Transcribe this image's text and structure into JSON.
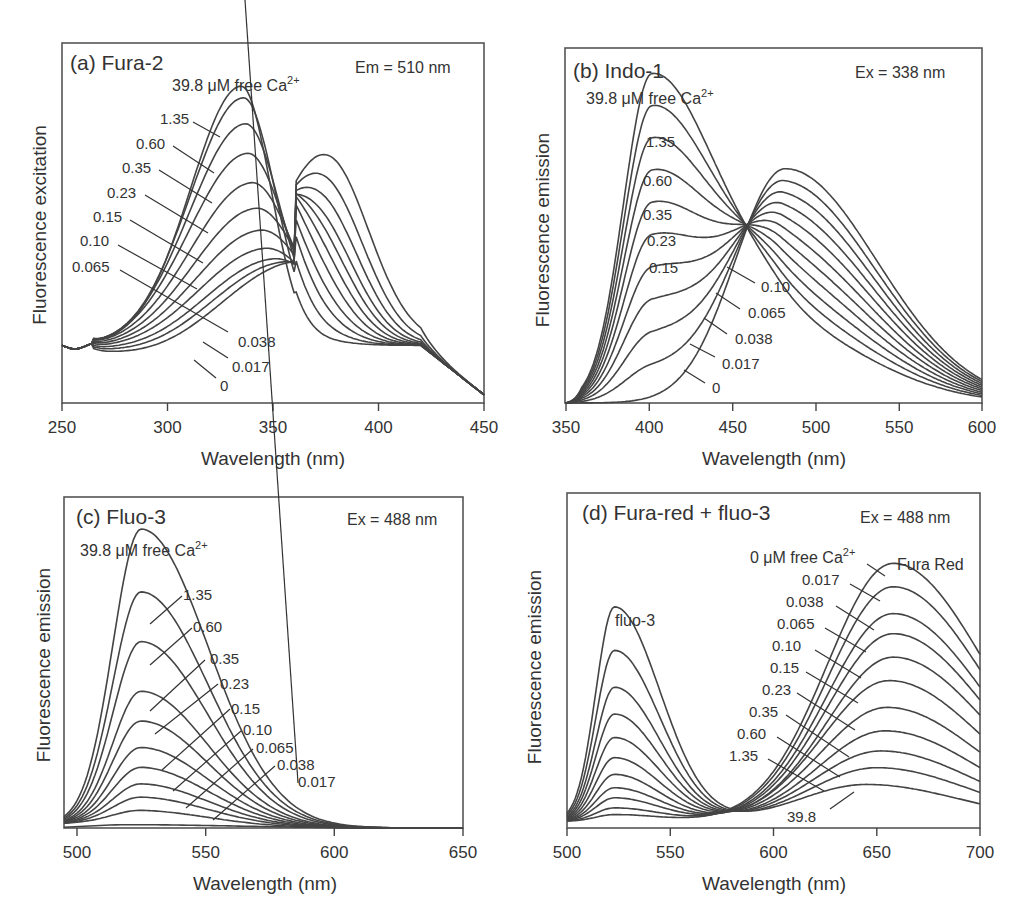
{
  "chart_data": [
    {
      "type": "line",
      "panel": "a",
      "title": "(a) Fura-2",
      "condition": "Em = 510 nm",
      "top_label": "39.8 μM free Ca2+",
      "xlabel": "Wavelength (nm)",
      "ylabel": "Fluorescence excitation",
      "xlim": [
        250,
        450
      ],
      "xticks": [
        250,
        300,
        350,
        400,
        450
      ],
      "grid": false,
      "isosbestic_point_nm": 360,
      "series_labels": [
        "39.8",
        "1.35",
        "0.60",
        "0.35",
        "0.23",
        "0.15",
        "0.10",
        "0.065",
        "0.038",
        "0.017",
        "0"
      ],
      "series": [
        {
          "name": "39.8",
          "peak_nm": 335,
          "peak_rel": 0.88
        },
        {
          "name": "1.35",
          "peak_nm": 336,
          "peak_rel": 0.85
        },
        {
          "name": "0.60",
          "peak_nm": 337,
          "peak_rel": 0.78
        },
        {
          "name": "0.35",
          "peak_nm": 338,
          "peak_rel": 0.7
        },
        {
          "name": "0.23",
          "peak_nm": 340,
          "peak_rel": 0.62
        },
        {
          "name": "0.15",
          "peak_nm": 342,
          "peak_rel": 0.55
        },
        {
          "name": "0.10",
          "peak_nm": 344,
          "peak_rel": 0.49
        },
        {
          "name": "0.065",
          "peak_nm": 346,
          "peak_rel": 0.44
        },
        {
          "name": "0.038",
          "peak_nm": 350,
          "peak_rel": 0.41
        },
        {
          "name": "0.017",
          "peak_nm": 355,
          "peak_rel": 0.4
        },
        {
          "name": "0",
          "peak_nm": 362,
          "peak_rel": 0.4
        }
      ]
    },
    {
      "type": "line",
      "panel": "b",
      "title": "(b) Indo-1",
      "condition": "Ex = 338 nm",
      "top_label": "39.8 μM free Ca2+",
      "xlabel": "Wavelength (nm)",
      "ylabel": "Fluorescence emission",
      "xlim": [
        350,
        600
      ],
      "xticks": [
        350,
        400,
        450,
        500,
        550,
        600
      ],
      "grid": false,
      "isosbestic_point_nm": 465,
      "series_labels": [
        "39.8",
        "1.35",
        "0.60",
        "0.35",
        "0.23",
        "0.15",
        "0.10",
        "0.065",
        "0.038",
        "0.017",
        "0"
      ],
      "series": [
        {
          "name": "39.8",
          "peak_nm": 402,
          "peak_rel": 0.92
        },
        {
          "name": "1.35",
          "peak_nm": 403,
          "peak_rel": 0.79
        },
        {
          "name": "0.60",
          "peak_nm": 405,
          "peak_rel": 0.67
        },
        {
          "name": "0.35",
          "peak_nm": 410,
          "peak_rel": 0.56
        },
        {
          "name": "0.23",
          "peak_nm": 420,
          "peak_rel": 0.49
        },
        {
          "name": "0.15",
          "peak_nm": 475,
          "peak_rel": 0.6
        },
        {
          "name": "0.10",
          "peak_nm": 477,
          "peak_rel": 0.61
        },
        {
          "name": "0.065",
          "peak_nm": 478,
          "peak_rel": 0.62
        },
        {
          "name": "0.038",
          "peak_nm": 479,
          "peak_rel": 0.63
        },
        {
          "name": "0.017",
          "peak_nm": 480,
          "peak_rel": 0.64
        },
        {
          "name": "0",
          "peak_nm": 482,
          "peak_rel": 0.66
        }
      ]
    },
    {
      "type": "line",
      "panel": "c",
      "title": "(c) Fluo-3",
      "condition": "Ex = 488 nm",
      "top_label": "39.8 μM free Ca2+",
      "xlabel": "Wavelength (nm)",
      "ylabel": "Fluorescence emission",
      "xlim": [
        495,
        650
      ],
      "xticks": [
        500,
        550,
        600,
        650
      ],
      "grid": false,
      "series_labels": [
        "39.8",
        "1.35",
        "0.60",
        "0.35",
        "0.23",
        "0.15",
        "0.10",
        "0.065",
        "0.038",
        "0.017"
      ],
      "series": [
        {
          "name": "39.8",
          "peak_nm": 525,
          "peak_rel": 0.89
        },
        {
          "name": "1.35",
          "peak_nm": 525,
          "peak_rel": 0.7
        },
        {
          "name": "0.60",
          "peak_nm": 525,
          "peak_rel": 0.55
        },
        {
          "name": "0.35",
          "peak_nm": 525,
          "peak_rel": 0.4
        },
        {
          "name": "0.23",
          "peak_nm": 525,
          "peak_rel": 0.31
        },
        {
          "name": "0.15",
          "peak_nm": 525,
          "peak_rel": 0.23
        },
        {
          "name": "0.10",
          "peak_nm": 525,
          "peak_rel": 0.17
        },
        {
          "name": "0.065",
          "peak_nm": 525,
          "peak_rel": 0.12
        },
        {
          "name": "0.038",
          "peak_nm": 525,
          "peak_rel": 0.08
        },
        {
          "name": "0.017",
          "peak_nm": 525,
          "peak_rel": 0.04
        }
      ]
    },
    {
      "type": "line",
      "panel": "d",
      "title": "(d) Fura-red + fluo-3",
      "condition": "Ex = 488 nm",
      "xlabel": "Wavelength (nm)",
      "ylabel": "Fluorescence emission",
      "xlim": [
        500,
        700
      ],
      "xticks": [
        500,
        550,
        600,
        650,
        700
      ],
      "grid": false,
      "annotations": [
        "fluo-3",
        "Fura Red",
        "0 μM free Ca2+"
      ],
      "isosbestic_point_nm": 590,
      "series_labels": [
        "0",
        "0.017",
        "0.038",
        "0.065",
        "0.10",
        "0.15",
        "0.23",
        "0.35",
        "0.60",
        "1.35",
        "39.8"
      ],
      "series": [
        {
          "name": "0",
          "fluo3_peak_rel": 0.02,
          "furared_peak_nm": 658,
          "furared_peak_rel": 0.77
        },
        {
          "name": "0.017",
          "fluo3_peak_rel": 0.04,
          "furared_peak_nm": 658,
          "furared_peak_rel": 0.7
        },
        {
          "name": "0.038",
          "fluo3_peak_rel": 0.07,
          "furared_peak_nm": 658,
          "furared_peak_rel": 0.62
        },
        {
          "name": "0.065",
          "fluo3_peak_rel": 0.1,
          "furared_peak_nm": 658,
          "furared_peak_rel": 0.56
        },
        {
          "name": "0.10",
          "fluo3_peak_rel": 0.14,
          "furared_peak_nm": 658,
          "furared_peak_rel": 0.49
        },
        {
          "name": "0.15",
          "fluo3_peak_rel": 0.19,
          "furared_peak_nm": 656,
          "furared_peak_rel": 0.42
        },
        {
          "name": "0.23",
          "fluo3_peak_rel": 0.25,
          "furared_peak_nm": 655,
          "furared_peak_rel": 0.34
        },
        {
          "name": "0.35",
          "fluo3_peak_rel": 0.32,
          "furared_peak_nm": 654,
          "furared_peak_rel": 0.27
        },
        {
          "name": "0.60",
          "fluo3_peak_rel": 0.4,
          "furared_peak_nm": 652,
          "furared_peak_rel": 0.21
        },
        {
          "name": "1.35",
          "fluo3_peak_rel": 0.51,
          "furared_peak_nm": 650,
          "furared_peak_rel": 0.16
        },
        {
          "name": "39.8",
          "fluo3_peak_rel": 0.64,
          "furared_peak_nm": 645,
          "furared_peak_rel": 0.11
        }
      ]
    }
  ],
  "panels": {
    "a": {
      "title": "(a) Fura-2",
      "condition": "Em = 510 nm",
      "top_label_main": "39.8 μM free Ca",
      "top_label_sup": "2+",
      "ylabel": "Fluorescence excitation",
      "xlabel": "Wavelength (nm)",
      "ticks": [
        "250",
        "300",
        "350",
        "400",
        "450"
      ],
      "labels": [
        "1.35",
        "0.60",
        "0.35",
        "0.23",
        "0.15",
        "0.10",
        "0.065",
        "0.038",
        "0.017",
        "0"
      ]
    },
    "b": {
      "title": "(b) Indo-1",
      "condition": "Ex = 338 nm",
      "top_label_main": "39.8 μM free Ca",
      "top_label_sup": "2+",
      "ylabel": "Fluorescence emission",
      "xlabel": "Wavelength (nm)",
      "ticks": [
        "350",
        "400",
        "450",
        "500",
        "550",
        "600"
      ],
      "labels": [
        "1.35",
        "0.60",
        "0.35",
        "0.23",
        "0.15",
        "0.10",
        "0.065",
        "0.038",
        "0.017",
        "0"
      ]
    },
    "c": {
      "title": "(c) Fluo-3",
      "condition": "Ex = 488 nm",
      "top_label_main": "39.8 μM free Ca",
      "top_label_sup": "2+",
      "ylabel": "Fluorescence emission",
      "xlabel": "Wavelength (nm)",
      "ticks": [
        "500",
        "550",
        "600",
        "650"
      ],
      "labels": [
        "1.35",
        "0.60",
        "0.35",
        "0.23",
        "0.15",
        "0.10",
        "0.065",
        "0.038",
        "0.017"
      ]
    },
    "d": {
      "title": "(d) Fura-red + fluo-3",
      "condition": "Ex = 488 nm",
      "top_label_main": "0 μM free Ca",
      "top_label_sup": "2+",
      "fluo3_label": "fluo-3",
      "furared_label": "Fura Red",
      "ylabel": "Fluorescence emission",
      "xlabel": "Wavelength (nm)",
      "ticks": [
        "500",
        "550",
        "600",
        "650",
        "700"
      ],
      "labels": [
        "0.017",
        "0.038",
        "0.065",
        "0.10",
        "0.15",
        "0.23",
        "0.35",
        "0.60",
        "1.35",
        "39.8"
      ]
    }
  }
}
